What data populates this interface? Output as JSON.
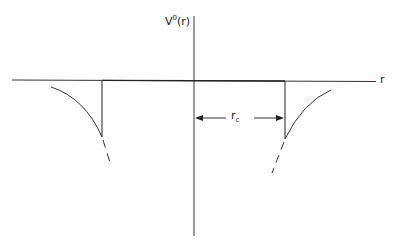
{
  "diagram": {
    "type": "potential-well-plot",
    "y_axis_label": {
      "base": "V",
      "superscript": "0",
      "arg": "(r)"
    },
    "x_axis_label": "r",
    "distance_label": {
      "base": "r",
      "subscript": "c"
    },
    "colors": {
      "line": "#333333",
      "background": "#ffffff"
    }
  }
}
